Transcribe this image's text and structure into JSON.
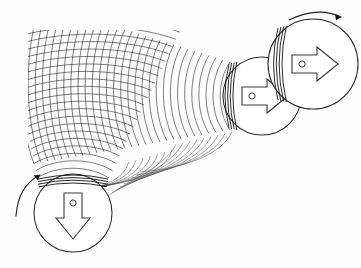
{
  "figure": {
    "background_color": "#fefefe",
    "ink_color": "#1a1a1a",
    "width": 361,
    "height": 268,
    "alt_text": "Hand-drawn style physics diagram: two circular bodies emit circular wavefronts that overlap in a cross-hatched interference region at the upper left."
  },
  "sources": [
    {
      "id": "source-right-upper",
      "label": "upper right source",
      "arrow_direction": "right",
      "arrow_glyph": "⇨",
      "center_x": 313,
      "center_y": 64,
      "radius": 45,
      "rotation_indicator": "clockwise",
      "emitter_edge": "left"
    },
    {
      "id": "source-right-middle",
      "label": "middle right source",
      "arrow_direction": "right",
      "arrow_glyph": "⇨",
      "center_x": 262,
      "center_y": 96,
      "radius": 39,
      "rotation_indicator": "none",
      "emitter_edge": "left"
    },
    {
      "id": "source-bottom-left",
      "label": "lower left source",
      "arrow_direction": "down",
      "arrow_glyph": "⇩",
      "center_x": 73,
      "center_y": 213,
      "radius": 39,
      "rotation_indicator": "counterclockwise",
      "emitter_edge": "top"
    }
  ],
  "wave_families": [
    {
      "id": "family-horizontal",
      "emitted_by": "right sources",
      "description": "arcs expanding leftward",
      "count": 34,
      "spacing": 7.0,
      "stroke_width": 0.65
    },
    {
      "id": "family-vertical",
      "emitted_by": "bottom-left source",
      "description": "arcs expanding upward",
      "count": 26,
      "spacing": 7.3,
      "stroke_width": 0.65
    }
  ],
  "interference_region": {
    "label": "cross-hatched overlap region",
    "x": 30,
    "y": 32,
    "width": 145,
    "height": 150
  },
  "rotation_markers": [
    {
      "id": "rot-top-right",
      "label": "clockwise rotation",
      "direction": "clockwise"
    },
    {
      "id": "rot-bottom-left",
      "label": "counterclockwise rotation",
      "direction": "counterclockwise"
    }
  ]
}
